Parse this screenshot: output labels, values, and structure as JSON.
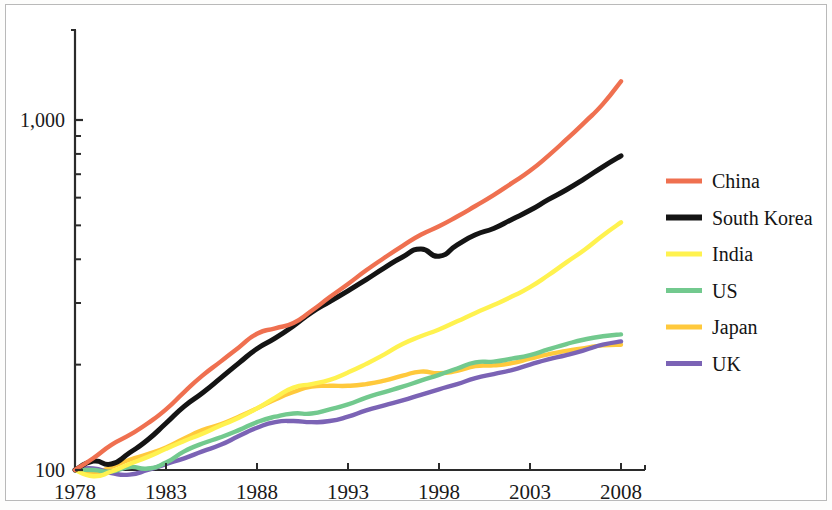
{
  "figure": {
    "background_color": "#ffffff",
    "frame_color": "#b9b9b9",
    "axis_color": "#2b2b2b"
  },
  "axis": {
    "y_tick_labels": [
      "1,000",
      "100"
    ],
    "y_label_1000": "1,000",
    "y_label_100": "100",
    "x_tick_labels": [
      "1978",
      "1983",
      "1988",
      "1993",
      "1998",
      "2003",
      "2008"
    ]
  },
  "legend": {
    "items": [
      {
        "label": "China",
        "color": "#EF7050"
      },
      {
        "label": "South Korea",
        "color": "#141414"
      },
      {
        "label": "India",
        "color": "#FFF24F"
      },
      {
        "label": "US",
        "color": "#72C98E"
      },
      {
        "label": "Japan",
        "color": "#FFC93C"
      },
      {
        "label": "UK",
        "color": "#7B63B5"
      }
    ]
  },
  "chart_data": {
    "type": "line",
    "title": "",
    "xlabel": "",
    "ylabel": "",
    "yscale": "log",
    "ylim": [
      90,
      1700
    ],
    "xlim": [
      1978,
      2008
    ],
    "grid": false,
    "legend_position": "right",
    "y_ticks_labeled": [
      100,
      1000
    ],
    "y_ticks_minor": [
      200,
      300,
      400,
      500,
      600,
      700,
      800,
      900
    ],
    "x_ticks": [
      1978,
      1983,
      1988,
      1993,
      1998,
      2003,
      2008
    ],
    "x": [
      1978,
      1979,
      1980,
      1981,
      1982,
      1983,
      1984,
      1985,
      1986,
      1987,
      1988,
      1989,
      1990,
      1991,
      1992,
      1993,
      1994,
      1995,
      1996,
      1997,
      1998,
      1999,
      2000,
      2001,
      2002,
      2003,
      2004,
      2005,
      2006,
      2007,
      2008
    ],
    "series": [
      {
        "name": "China",
        "color": "#EF7050",
        "values": [
          100,
          108,
          118,
          126,
          136,
          149,
          167,
          186,
          204,
          224,
          245,
          254,
          263,
          285,
          312,
          340,
          372,
          404,
          437,
          470,
          497,
          530,
          568,
          610,
          660,
          716,
          790,
          880,
          985,
          1110,
          1290
        ]
      },
      {
        "name": "South Korea",
        "color": "#141414",
        "values": [
          100,
          106,
          104,
          112,
          122,
          136,
          152,
          166,
          183,
          202,
          222,
          238,
          258,
          282,
          303,
          325,
          350,
          378,
          406,
          428,
          408,
          440,
          470,
          490,
          520,
          552,
          592,
          632,
          680,
          735,
          790
        ]
      },
      {
        "name": "India",
        "color": "#FFF24F",
        "values": [
          100,
          96,
          99,
          104,
          109,
          115,
          121,
          127,
          134,
          141,
          150,
          161,
          172,
          176,
          181,
          190,
          201,
          214,
          229,
          241,
          252,
          266,
          281,
          296,
          313,
          333,
          360,
          392,
          426,
          468,
          510
        ]
      },
      {
        "name": "US",
        "color": "#72C98E",
        "values": [
          100,
          100,
          99,
          102,
          101,
          105,
          113,
          119,
          124,
          130,
          137,
          142,
          145,
          145,
          149,
          154,
          161,
          167,
          173,
          180,
          187,
          195,
          203,
          204,
          208,
          213,
          221,
          229,
          236,
          241,
          244
        ]
      },
      {
        "name": "Japan",
        "color": "#FFC93C",
        "values": [
          100,
          98,
          102,
          107,
          111,
          116,
          123,
          130,
          135,
          142,
          150,
          159,
          167,
          173,
          174,
          174,
          176,
          180,
          186,
          191,
          189,
          192,
          198,
          199,
          202,
          208,
          214,
          219,
          223,
          227,
          228
        ]
      },
      {
        "name": "UK",
        "color": "#7B63B5",
        "values": [
          100,
          101,
          98,
          97,
          100,
          104,
          108,
          113,
          118,
          125,
          132,
          137,
          138,
          137,
          138,
          142,
          148,
          153,
          158,
          164,
          170,
          176,
          183,
          188,
          193,
          200,
          207,
          213,
          220,
          228,
          233
        ]
      }
    ]
  }
}
